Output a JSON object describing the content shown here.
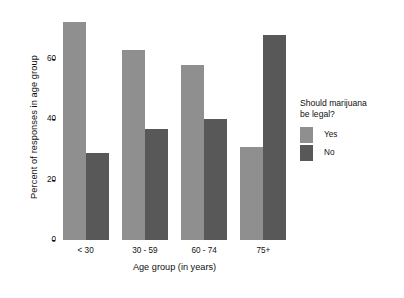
{
  "chart_data": {
    "type": "bar",
    "title": "",
    "subtitle": "",
    "xlabel": "Age group (in years)",
    "ylabel": "Percent of responses in age group",
    "categories": [
      "< 30",
      "30 - 59",
      "60 - 74",
      "75+"
    ],
    "series": [
      {
        "name": "Yes",
        "color": "#8f8f8f",
        "values": [
          72.5,
          63.0,
          58.0,
          31.0
        ]
      },
      {
        "name": "No",
        "color": "#585858",
        "values": [
          29.0,
          37.0,
          40.0,
          68.0
        ]
      }
    ],
    "ylim": [
      0,
      75
    ],
    "yticks": [
      0,
      20,
      40,
      60
    ],
    "ytick_labels": [
      "0",
      "20",
      "40",
      "60"
    ],
    "grid": false,
    "legend": {
      "title": "Should marijuana\nbe legal?",
      "position": "right",
      "entries": [
        {
          "label": "Yes",
          "color": "#8f8f8f"
        },
        {
          "label": "No",
          "color": "#585858"
        }
      ]
    },
    "background": "#ffffff",
    "bar_group_gap": true
  }
}
